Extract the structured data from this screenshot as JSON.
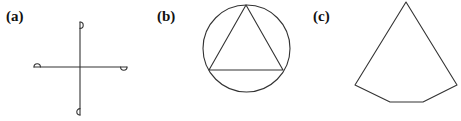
{
  "panels": [
    {
      "id": "a",
      "label": "(a)",
      "shape": "cross-with-end-loops",
      "description": "Two perpendicular line segments crossing at center; each of the four ends terminates in a small semicircular hook",
      "label_pos": [
        6,
        9
      ],
      "vertical": {
        "x": 80,
        "y1": 22,
        "y2": 115
      },
      "horizontal": {
        "y": 67,
        "x1": 34,
        "x2": 127
      },
      "hooks": [
        {
          "end": "top",
          "direction": "right"
        },
        {
          "end": "bottom",
          "direction": "left"
        },
        {
          "end": "left",
          "direction": "up"
        },
        {
          "end": "right",
          "direction": "down"
        }
      ]
    },
    {
      "id": "b",
      "label": "(b)",
      "shape": "triangle-inscribed-in-circle",
      "label_pos": [
        157,
        9
      ],
      "circle": {
        "cx": 246.5,
        "cy": 48.5,
        "r": 43.5
      },
      "triangle": [
        [
          246,
          5
        ],
        [
          209,
          70
        ],
        [
          283,
          70
        ]
      ]
    },
    {
      "id": "c",
      "label": "(c)",
      "shape": "pentagon",
      "label_pos": [
        313,
        9
      ],
      "vertices": [
        [
          406,
          2
        ],
        [
          457,
          85
        ],
        [
          423,
          102
        ],
        [
          390,
          102
        ],
        [
          355,
          85
        ]
      ]
    }
  ],
  "colors": {
    "stroke": "#333333",
    "label": "#111111",
    "background": "#ffffff"
  }
}
